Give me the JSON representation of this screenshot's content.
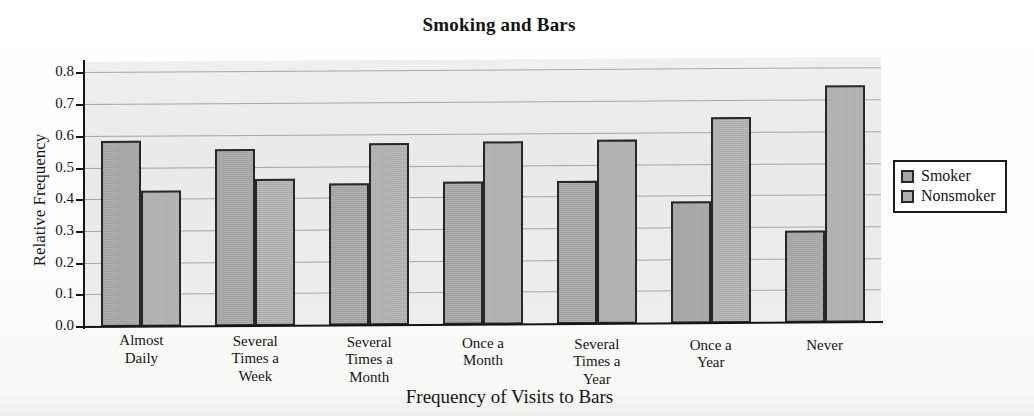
{
  "chart_data": {
    "type": "bar",
    "title": "Smoking and Bars",
    "xlabel": "Frequency of Visits to Bars",
    "ylabel": "Relative Frequency",
    "categories": [
      "Almost Daily",
      "Several Times a Week",
      "Several Times a Month",
      "Once a Month",
      "Several Times a Year",
      "Once a Year",
      "Never"
    ],
    "category_lines": [
      [
        "Almost",
        "Daily"
      ],
      [
        "Several",
        "Times a",
        "Week"
      ],
      [
        "Several",
        "Times a",
        "Month"
      ],
      [
        "Once a",
        "Month"
      ],
      [
        "Several",
        "Times a",
        "Year"
      ],
      [
        "Once a",
        "Year"
      ],
      [
        "Never"
      ]
    ],
    "series": [
      {
        "name": "Smoker",
        "color": "#a5a5a5",
        "values": [
          0.587,
          0.56,
          0.448,
          0.45,
          0.452,
          0.385,
          0.29
        ]
      },
      {
        "name": "Nonsmoker",
        "color": "#b0b0b0",
        "values": [
          0.43,
          0.463,
          0.575,
          0.578,
          0.582,
          0.65,
          0.748
        ]
      }
    ],
    "ylim": [
      0.0,
      0.836
    ],
    "yticks": [
      0.0,
      0.1,
      0.2,
      0.3,
      0.4,
      0.5,
      0.6,
      0.7,
      0.8
    ],
    "ytick_labels": [
      "0.0",
      "0.1",
      "0.2",
      "0.3",
      "0.4",
      "0.5",
      "0.6",
      "0.7",
      "0.8"
    ],
    "grid": true,
    "grid_axis": "y",
    "legend_position": "right",
    "bar_style": "grouped-adjacent",
    "plot_background": "#ebebeb"
  },
  "legend": {
    "items": [
      {
        "label": "Smoker"
      },
      {
        "label": "Nonsmoker"
      }
    ]
  }
}
